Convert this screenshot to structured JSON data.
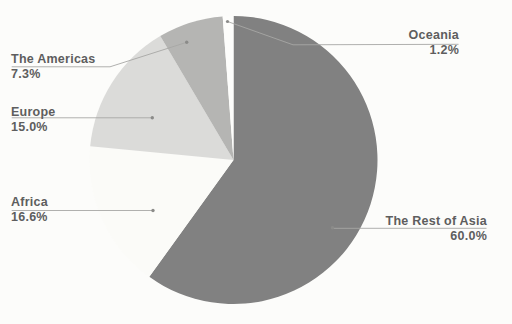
{
  "chart_data": {
    "type": "pie",
    "title": "",
    "direction": "clockwise",
    "start_angle_deg": 0,
    "legend_position": "callouts",
    "slices": [
      {
        "label": "The Rest of Asia",
        "value": 60.0,
        "pct_label": "60.0%",
        "color": "#818181"
      },
      {
        "label": "Africa",
        "value": 16.6,
        "pct_label": "16.6%",
        "color": "#fbfbf8"
      },
      {
        "label": "Europe",
        "value": 15.0,
        "pct_label": "15.0%",
        "color": "#dbdbd9"
      },
      {
        "label": "The Americas",
        "value": 7.3,
        "pct_label": "7.3%",
        "color": "#b5b5b3"
      },
      {
        "label": "Oceania",
        "value": 1.2,
        "pct_label": "1.2%",
        "color": "#fdfdfb"
      }
    ],
    "colors_note": {
      "background": "#fcfcfa",
      "label_text": "#5e5e5e",
      "leader_line": "#a7a7a5"
    }
  }
}
